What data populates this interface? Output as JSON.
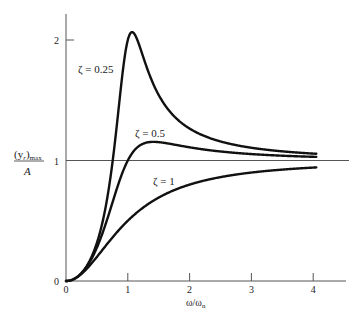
{
  "chart_data": {
    "type": "line",
    "title": "",
    "xlabel": "ω/ωn",
    "ylabel": "(y_r)max / A",
    "ylabel_parts": {
      "numerator": "(y",
      "subscript_r": "r",
      "close": ")",
      "subscript_max": "max",
      "denominator": "A"
    },
    "xlim": [
      0,
      4.5
    ],
    "ylim": [
      0,
      2.2
    ],
    "x_ticks": [
      0,
      1,
      2,
      3,
      4
    ],
    "x_tick_labels": [
      "0",
      "1",
      "2",
      "3",
      "4"
    ],
    "y_ticks": [
      0,
      1,
      2
    ],
    "y_tick_labels": [
      "0",
      "1",
      "2"
    ],
    "grid": false,
    "legend": "none (inline curve labels)",
    "reference_lines": [
      {
        "orientation": "horizontal",
        "y": 1
      }
    ],
    "x": [
      0,
      0.2,
      0.4,
      0.6,
      0.8,
      0.9,
      1.0,
      1.1,
      1.2,
      1.4,
      1.6,
      1.8,
      2.0,
      2.5,
      3.0,
      3.5,
      4.0
    ],
    "series": [
      {
        "name": "ζ = 0.25",
        "zeta": 0.25,
        "label": "ζ = 0.25",
        "values": [
          0,
          0.04,
          0.18,
          0.5,
          1.12,
          1.62,
          2.0,
          1.9,
          1.52,
          1.01,
          0.76,
          0.64,
          0.57,
          0.48,
          0.44,
          0.42,
          0.41
        ],
        "peak": {
          "x": 0.97,
          "y": 2.03
        }
      },
      {
        "name": "ζ = 0.5",
        "zeta": 0.5,
        "label": "ζ = 0.5",
        "values": [
          0,
          0.04,
          0.17,
          0.41,
          0.73,
          0.88,
          1.0,
          1.08,
          1.12,
          1.13,
          1.11,
          1.09,
          1.08,
          1.05,
          1.04,
          1.03,
          1.02
        ],
        "peak": {
          "x": 1.41,
          "y": 1.15
        }
      },
      {
        "name": "ζ = 1",
        "zeta": 1.0,
        "label": "ζ = 1",
        "values": [
          0,
          0.04,
          0.14,
          0.26,
          0.39,
          0.45,
          0.5,
          0.55,
          0.59,
          0.66,
          0.72,
          0.76,
          0.8,
          0.86,
          0.9,
          0.92,
          0.94
        ]
      }
    ],
    "formula": "(y_r)max/A = r^2 / sqrt((1-r^2)^2 + (2 ζ r)^2), r = ω/ωn"
  },
  "labels": {
    "zeta_025": "ζ = 0.25",
    "zeta_05": "ζ = 0.5",
    "zeta_1": "ζ = 1",
    "y_num": "(y",
    "y_sub_r": "r",
    "y_close": ")",
    "y_sub_max": "max",
    "y_den": "A",
    "x_main": "ω/ω",
    "x_sub": "n",
    "origin": "0"
  }
}
